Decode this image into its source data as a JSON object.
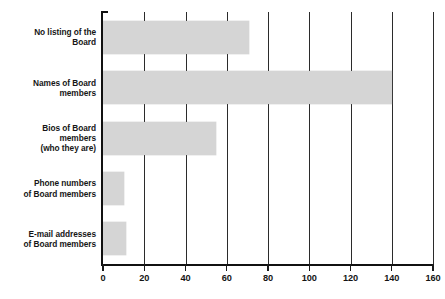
{
  "chart_data": {
    "type": "bar",
    "orientation": "horizontal",
    "title": "",
    "xlabel": "",
    "ylabel": "",
    "xlim": [
      0,
      160
    ],
    "xticks": [
      0,
      20,
      40,
      60,
      80,
      100,
      120,
      140,
      160
    ],
    "xtick_labels": [
      "0",
      "20",
      "40",
      "60",
      "80",
      "100",
      "120",
      "140",
      "160"
    ],
    "grid": "vertical",
    "legend": "none",
    "bar_color": "#d5d5d5",
    "axis_color": "#111111",
    "text_color": "#161616",
    "categories": [
      "No listing of the Board",
      "Names of Board members",
      "Bios of Board members (who they are)",
      "Phone numbers of Board members",
      "E-mail addresses of Board members"
    ],
    "category_lines": [
      [
        "No listing of the",
        "Board"
      ],
      [
        "Names of Board",
        "members"
      ],
      [
        "Bios of Board",
        "members",
        "(who they are)"
      ],
      [
        "Phone numbers",
        "of Board members"
      ],
      [
        "E-mail addresses",
        "of Board members"
      ]
    ],
    "values": [
      71,
      140,
      55,
      10,
      11
    ]
  }
}
